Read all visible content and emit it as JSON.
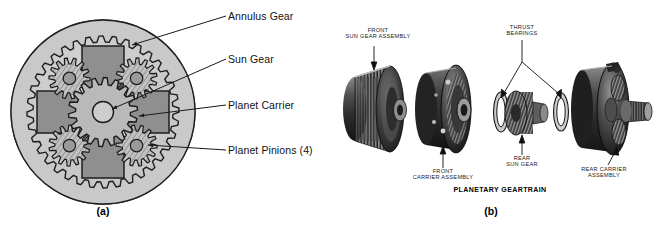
{
  "figure": {
    "caption_a": "(a)",
    "caption_b": "(b)",
    "panel_b_title": "PLANETARY GEARTRAIN"
  },
  "panel_a": {
    "name": "planetary-gearset-cross-section",
    "labels": [
      {
        "id": "annulus-gear",
        "text": "Annulus Gear"
      },
      {
        "id": "sun-gear",
        "text": "Sun Gear"
      },
      {
        "id": "planet-carrier",
        "text": "Planet Carrier"
      },
      {
        "id": "planet-pinions",
        "text": "Planet Pinions (4)"
      }
    ],
    "colors": {
      "annulus_ring_fill": "#c9c9c9",
      "carrier_fill": "#8f8f8f",
      "gear_body_fill": "#b4b4b4",
      "hub_fill": "#cdcdcd",
      "outline": "#1a1a1a",
      "label_text": "#111111"
    },
    "geometry": {
      "annulus_teeth": 36,
      "sun_teeth": 18,
      "pinion_teeth": 14,
      "planet_count": 4
    }
  },
  "panel_b": {
    "name": "planetary-geartrain-photograph",
    "labels": [
      {
        "id": "front-sun-gear-assembly",
        "line1": "FRONT",
        "line2": "SUN GEAR ASSEMBLY"
      },
      {
        "id": "thrust-bearings",
        "line1": "THRUST",
        "line2": "BEARINGS"
      },
      {
        "id": "front-carrier-assembly",
        "line1": "FRONT",
        "line2": "CARRIER ASSEMBLY"
      },
      {
        "id": "rear-sun-gear",
        "line1": "REAR",
        "line2": "SUN GEAR"
      },
      {
        "id": "rear-carrier-assembly",
        "line1": "REAR CARRIER",
        "line2": "ASSEMBLY"
      }
    ],
    "components": [
      "front sun gear assembly drum",
      "front carrier assembly drum",
      "thrust bearing washer left",
      "rear sun gear",
      "thrust bearing washer right",
      "rear carrier assembly with output shaft"
    ],
    "colors": {
      "photo_dark": "#2a2a2a",
      "photo_mid": "#6e6e6e",
      "photo_light": "#cfcfcf",
      "background": "#ffffff"
    }
  }
}
